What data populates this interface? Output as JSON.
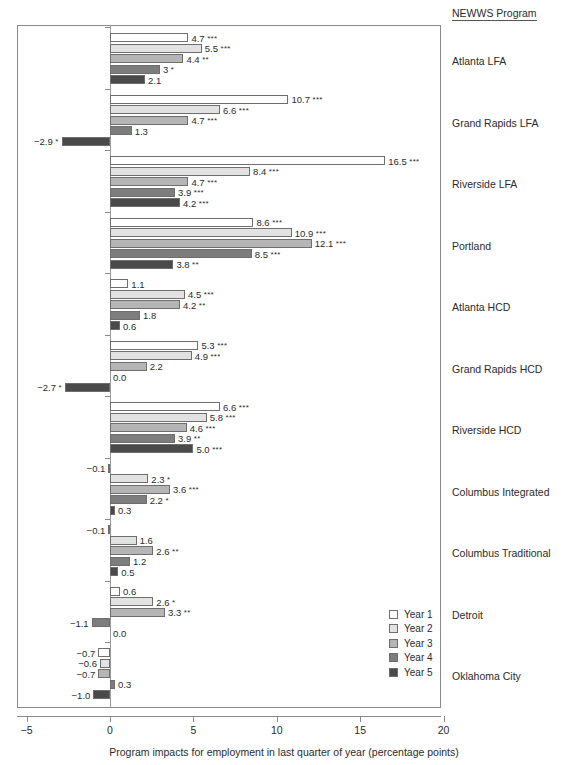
{
  "header": {
    "title": "NEWWS Program"
  },
  "axis": {
    "caption": "Program impacts for employment in last quarter of year (percentage points)",
    "ticks": [
      "-5",
      "0",
      "5",
      "10",
      "15",
      "20"
    ],
    "tick_values": [
      -5,
      0,
      5,
      10,
      15,
      20
    ],
    "xmin": -5,
    "xmax": 20
  },
  "legend": {
    "items": [
      {
        "label": "Year 1",
        "color": "#ffffff"
      },
      {
        "label": "Year 2",
        "color": "#e2e2e2"
      },
      {
        "label": "Year 3",
        "color": "#b5b5b5"
      },
      {
        "label": "Year 4",
        "color": "#7d7d7d"
      },
      {
        "label": "Year 5",
        "color": "#4a4a4a"
      }
    ]
  },
  "chart_data": {
    "type": "bar",
    "orientation": "horizontal",
    "title": "",
    "xlabel": "Program impacts for employment in last quarter of year (percentage points)",
    "ylabel": "NEWWS Program",
    "xlim": [
      -5,
      20
    ],
    "grid": false,
    "legend_position": "bottom-right",
    "categories": [
      "Atlanta LFA",
      "Grand Rapids LFA",
      "Riverside LFA",
      "Portland",
      "Atlanta HCD",
      "Grand Rapids HCD",
      "Riverside HCD",
      "Columbus Integrated",
      "Columbus Traditional",
      "Detroit",
      "Oklahoma City"
    ],
    "series": [
      {
        "name": "Year 1",
        "values": [
          4.7,
          10.7,
          16.5,
          8.6,
          1.1,
          5.3,
          6.6,
          -0.1,
          -0.1,
          0.6,
          -0.7
        ]
      },
      {
        "name": "Year 2",
        "values": [
          5.5,
          6.6,
          8.4,
          10.9,
          4.5,
          4.9,
          5.8,
          2.3,
          1.6,
          2.6,
          -0.6
        ]
      },
      {
        "name": "Year 3",
        "values": [
          4.4,
          4.7,
          4.7,
          12.1,
          4.2,
          2.2,
          4.6,
          3.6,
          2.6,
          3.3,
          -0.7
        ]
      },
      {
        "name": "Year 4",
        "values": [
          3.0,
          1.3,
          3.9,
          8.5,
          1.8,
          0.0,
          3.9,
          2.2,
          1.2,
          -1.1,
          0.3
        ]
      },
      {
        "name": "Year 5",
        "values": [
          2.1,
          -2.9,
          4.2,
          3.8,
          0.6,
          -2.7,
          5.0,
          0.3,
          0.5,
          0.0,
          -1.0
        ]
      }
    ],
    "labels": [
      {
        "group": "Atlanta LFA",
        "values": [
          "4.7",
          "5.5",
          "4.4",
          "3",
          "2.1"
        ],
        "stars": [
          "***",
          "***",
          "**",
          "*",
          ""
        ]
      },
      {
        "group": "Grand Rapids LFA",
        "values": [
          "10.7",
          "6.6",
          "4.7",
          "1.3",
          "-2.9"
        ],
        "stars": [
          "***",
          "***",
          "***",
          "",
          "*"
        ]
      },
      {
        "group": "Riverside LFA",
        "values": [
          "16.5",
          "8.4",
          "4.7",
          "3.9",
          "4.2"
        ],
        "stars": [
          "***",
          "***",
          "***",
          "***",
          "***"
        ]
      },
      {
        "group": "Portland",
        "values": [
          "8.6",
          "10.9",
          "12.1",
          "8.5",
          "3.8"
        ],
        "stars": [
          "***",
          "***",
          "***",
          "***",
          "**"
        ]
      },
      {
        "group": "Atlanta HCD",
        "values": [
          "1.1",
          "4.5",
          "4.2",
          "1.8",
          "0.6"
        ],
        "stars": [
          "",
          "***",
          "**",
          "",
          ""
        ]
      },
      {
        "group": "Grand Rapids HCD",
        "values": [
          "5.3",
          "4.9",
          "2.2",
          "0.0",
          "-2.7"
        ],
        "stars": [
          "***",
          "***",
          "",
          "",
          "*"
        ]
      },
      {
        "group": "Riverside HCD",
        "values": [
          "6.6",
          "5.8",
          "4.6",
          "3.9",
          "5.0"
        ],
        "stars": [
          "***",
          "***",
          "***",
          "**",
          "***"
        ]
      },
      {
        "group": "Columbus Integrated",
        "values": [
          "-0.1",
          "2.3",
          "3.6",
          "2.2",
          "0.3"
        ],
        "stars": [
          "",
          "*",
          "***",
          "*",
          ""
        ]
      },
      {
        "group": "Columbus Traditional",
        "values": [
          "-0.1",
          "1.6",
          "2.6",
          "1.2",
          "0.5"
        ],
        "stars": [
          "",
          "",
          "**",
          "",
          ""
        ]
      },
      {
        "group": "Detroit",
        "values": [
          "0.6",
          "2.6",
          "3.3",
          "-1.1",
          "0.0"
        ],
        "stars": [
          "",
          "*",
          "**",
          "",
          ""
        ]
      },
      {
        "group": "Oklahoma City",
        "values": [
          "-0.7",
          "-0.6",
          "-0.7",
          "0.3",
          "-1.0"
        ],
        "stars": [
          "",
          "",
          "",
          "",
          ""
        ]
      }
    ],
    "significance_note": "* p<.10, ** p<.05, *** p<.01"
  }
}
